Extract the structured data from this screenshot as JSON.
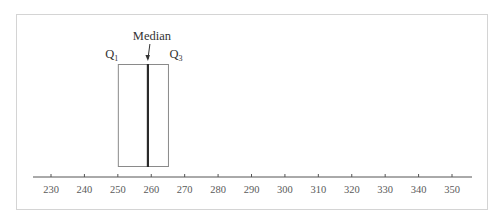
{
  "chart_data": {
    "type": "boxplot",
    "title": "",
    "xlabel": "",
    "ylabel": "",
    "x_ticks": [
      230,
      240,
      250,
      260,
      270,
      280,
      290,
      300,
      310,
      320,
      330,
      340,
      350
    ],
    "xlim": [
      225,
      356
    ],
    "box": {
      "q1": 250,
      "median": 259,
      "q3": 265
    },
    "annotations": [
      {
        "text": "Median",
        "target": "median"
      },
      {
        "text": "Q1",
        "target": "q1"
      },
      {
        "text": "Q3",
        "target": "q3"
      }
    ],
    "grid": false,
    "legend": null
  },
  "labels": {
    "median": "Median",
    "q1_main": "Q",
    "q1_sub": "1",
    "q3_main": "Q",
    "q3_sub": "3"
  },
  "colors": {
    "axis": "#555555",
    "box_border": "#8a8a8a",
    "median_line": "#2a2a2a",
    "frame": "#d4d4d4"
  }
}
